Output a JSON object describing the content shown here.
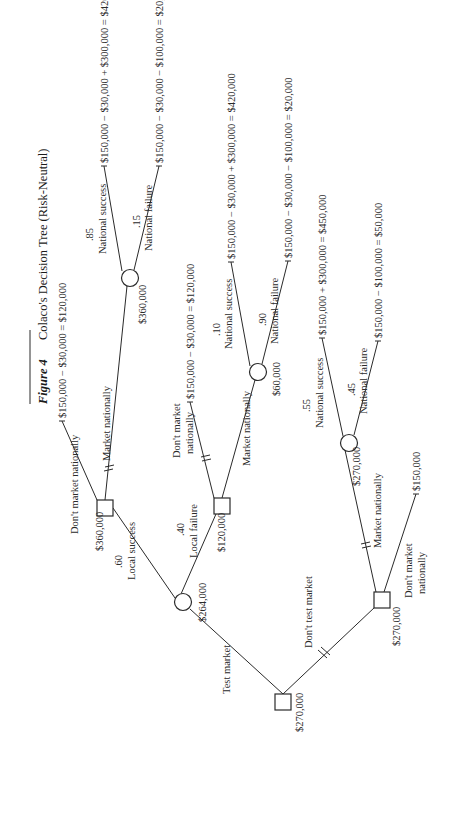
{
  "figure": {
    "label": "Figure 4",
    "title": "Colaco's Decision Tree (Risk-Neutral)"
  },
  "nodes": {
    "root": {
      "type": "decision",
      "value": "$270,000"
    },
    "local_chance": {
      "type": "chance",
      "value": "$264,000"
    },
    "after_local_success": {
      "type": "decision",
      "value": "$360,000"
    },
    "national_chance_A": {
      "type": "chance",
      "value": "$360,000"
    },
    "after_local_failure": {
      "type": "decision",
      "value": "$120,000"
    },
    "national_chance_B": {
      "type": "chance",
      "value": "$60,000"
    },
    "no_test_decision": {
      "type": "decision",
      "value": "$270,000"
    },
    "national_chance_C": {
      "type": "chance",
      "value": "$270,000"
    }
  },
  "branches": {
    "test_market": "Test market",
    "dont_test_market": "Don't test market",
    "local_success": {
      "label": "Local success",
      "prob": ".60"
    },
    "local_failure": {
      "label": "Local failure",
      "prob": ".40"
    },
    "A_dont_market": "Don't market nationally",
    "A_market": "Market nationally",
    "A_nat_success": {
      "label": "National success",
      "prob": ".85"
    },
    "A_nat_failure": {
      "label": "National failure",
      "prob": ".15"
    },
    "B_dont_market_1": "Don't market",
    "B_dont_market_2": "nationally",
    "B_market": "Market nationally",
    "B_nat_success": {
      "label": "National success",
      "prob": ".10"
    },
    "B_nat_failure": {
      "label": "National failure",
      "prob": ".90"
    },
    "C_market": "Market nationally",
    "C_dont_market_1": "Don't market",
    "C_dont_market_2": "nationally",
    "C_nat_success": {
      "label": "National success",
      "prob": ".55"
    },
    "C_nat_failure": {
      "label": "National failure",
      "prob": ".45"
    }
  },
  "payoffs": {
    "A_dont": "$150,000  −  $30,000  =  $120,000",
    "A_success": "$150,000  −  $30,000  +  $300,000  =  $420,000",
    "A_failure": "$150,000  −  $30,000  −  $100,000  =  $20,000",
    "B_dont": "$150,000  −  $30,000  =  $120,000",
    "B_success": "$150,000  −  $30,000  +  $300,000  =  $420,000",
    "B_failure": "$150,000  −  $30,000  −  $100,000  =  $20,000",
    "C_success": "$150,000  +  $300,000  =  $450,000",
    "C_failure": "$150,000  −  $100,000  =  $50,000",
    "C_dont": "$150,000"
  }
}
